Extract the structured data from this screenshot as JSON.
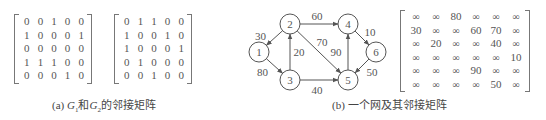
{
  "panel_a": {
    "caption_prefix": "(a) ",
    "g1_label": "G",
    "g1_sub": "1",
    "conj": "和",
    "g2_label": "G",
    "g2_sub": "2",
    "caption_suffix": "的邻接矩阵",
    "matrix_g1": [
      [
        "0",
        "0",
        "1",
        "0",
        "0"
      ],
      [
        "1",
        "0",
        "0",
        "0",
        "1"
      ],
      [
        "0",
        "0",
        "0",
        "0",
        "0"
      ],
      [
        "1",
        "1",
        "1",
        "0",
        "0"
      ],
      [
        "0",
        "0",
        "0",
        "1",
        "0"
      ]
    ],
    "matrix_g2": [
      [
        "0",
        "1",
        "1",
        "0",
        "0"
      ],
      [
        "1",
        "0",
        "0",
        "1",
        "0"
      ],
      [
        "1",
        "0",
        "0",
        "0",
        "1"
      ],
      [
        "0",
        "1",
        "0",
        "0",
        "0"
      ],
      [
        "0",
        "0",
        "1",
        "0",
        "0"
      ]
    ]
  },
  "panel_b": {
    "caption": "(b) 一个网及其邻接矩阵",
    "graph": {
      "nodes": [
        {
          "id": "1",
          "x": 259,
          "y": 52
        },
        {
          "id": "2",
          "x": 290,
          "y": 24
        },
        {
          "id": "3",
          "x": 290,
          "y": 80
        },
        {
          "id": "4",
          "x": 348,
          "y": 24
        },
        {
          "id": "5",
          "x": 348,
          "y": 80
        },
        {
          "id": "6",
          "x": 376,
          "y": 52
        }
      ],
      "edges": [
        {
          "from": "2",
          "to": "1",
          "weight": "30"
        },
        {
          "from": "1",
          "to": "3",
          "weight": "80"
        },
        {
          "from": "3",
          "to": "2",
          "weight": "20"
        },
        {
          "from": "2",
          "to": "4",
          "weight": "60"
        },
        {
          "from": "2",
          "to": "5",
          "weight": "70"
        },
        {
          "from": "3",
          "to": "5",
          "weight": "40"
        },
        {
          "from": "5",
          "to": "4",
          "weight": "90"
        },
        {
          "from": "4",
          "to": "6",
          "weight": "10"
        },
        {
          "from": "6",
          "to": "5",
          "weight": "50"
        }
      ]
    },
    "matrix": [
      [
        "∞",
        "∞",
        "80",
        "∞",
        "∞",
        "∞"
      ],
      [
        "30",
        "∞",
        "∞",
        "60",
        "70",
        "∞"
      ],
      [
        "∞",
        "20",
        "∞",
        "∞",
        "40",
        "∞"
      ],
      [
        "∞",
        "∞",
        "∞",
        "∞",
        "∞",
        "10"
      ],
      [
        "∞",
        "∞",
        "∞",
        "90",
        "∞",
        "∞"
      ],
      [
        "∞",
        "∞",
        "∞",
        "∞",
        "50",
        "∞"
      ]
    ]
  }
}
